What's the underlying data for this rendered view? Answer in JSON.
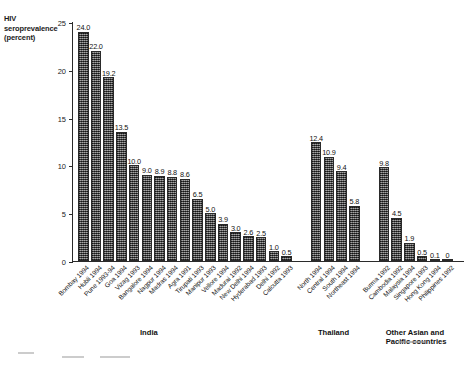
{
  "chart_data": {
    "type": "bar",
    "title": "",
    "xlabel": "",
    "ylabel": "HIV seroprevalence (percent)",
    "ylabel_lines": [
      "HIV",
      "seroprevalence",
      "(percent)"
    ],
    "ylim": [
      0,
      25
    ],
    "yticks": [
      0,
      5,
      10,
      15,
      20,
      25
    ],
    "ytick_labels": [
      "0",
      "5",
      "10",
      "15",
      "20",
      "25"
    ],
    "grid": false,
    "legend": "none",
    "bar_color": "#5a5a5a",
    "categories": [
      "Bombay 1994",
      "Hubli 1994",
      "Pune 1993-94",
      "Goa 1994",
      "Vizag 1993",
      "Bangalore 1994",
      "Nagpur 1994",
      "Madras 1994",
      "Agra 1991",
      "Tirupati 1993",
      "Manipur 1993",
      "Vellore 1994",
      "Madurai 1992",
      "New Delhi 1994",
      "Hyderabad 1993",
      "Delhi 1992",
      "Calcutta 1993",
      "North 1994",
      "Central 1994",
      "South 1994",
      "Northeast 1994",
      "Burma 1992",
      "Cambodia 1992",
      "Malaysia 1994",
      "Singapore 1993",
      "Hong Kong 1994",
      "Philippines 1992"
    ],
    "values": [
      24.0,
      22.0,
      19.2,
      13.5,
      10.0,
      9.0,
      8.9,
      8.8,
      8.6,
      6.5,
      5.0,
      3.9,
      3.0,
      2.6,
      2.5,
      1.0,
      0.5,
      12.4,
      10.9,
      9.4,
      5.8,
      9.8,
      4.5,
      1.9,
      0.5,
      0.1,
      0
    ],
    "value_labels": [
      "24.0",
      "22.0",
      "19.2",
      "13.5",
      "10.0",
      "9.0",
      "8.9",
      "8.8",
      "8.6",
      "6.5",
      "5.0",
      "3.9",
      "3.0",
      "2.6",
      "2.5",
      "1.0",
      "0.5",
      "12.4",
      "10.9",
      "9.4",
      "5.8",
      "9.8",
      "4.5",
      "1.9",
      "0.5",
      "0.1",
      "0"
    ],
    "groups": [
      {
        "name": "India",
        "caption": "India",
        "start_index": 0,
        "count": 17,
        "categories": [
          "Bombay 1994",
          "Hubli 1994",
          "Pune 1993-94",
          "Goa 1994",
          "Vizag 1993",
          "Bangalore 1994",
          "Nagpur 1994",
          "Madras 1994",
          "Agra 1991",
          "Tirupati 1993",
          "Manipur 1993",
          "Vellore 1994",
          "Madurai 1992",
          "New Delhi 1994",
          "Hyderabad 1993",
          "Delhi 1992",
          "Calcutta 1993"
        ],
        "values": [
          24.0,
          22.0,
          19.2,
          13.5,
          10.0,
          9.0,
          8.9,
          8.8,
          8.6,
          6.5,
          5.0,
          3.9,
          3.0,
          2.6,
          2.5,
          1.0,
          0.5
        ]
      },
      {
        "name": "Thailand",
        "caption": "Thailand",
        "start_index": 17,
        "count": 4,
        "categories": [
          "North 1994",
          "Central 1994",
          "South 1994",
          "Northeast 1994"
        ],
        "values": [
          12.4,
          10.9,
          9.4,
          5.8
        ]
      },
      {
        "name": "Other Asian and Pacific countries",
        "caption": "Other Asian and\nPacific countries",
        "start_index": 21,
        "count": 6,
        "categories": [
          "Burma 1992",
          "Cambodia 1992",
          "Malaysia 1994",
          "Singapore 1993",
          "Hong Kong 1994",
          "Philippines 1992"
        ],
        "values": [
          9.8,
          4.5,
          1.9,
          0.5,
          0.1,
          0
        ]
      }
    ]
  }
}
